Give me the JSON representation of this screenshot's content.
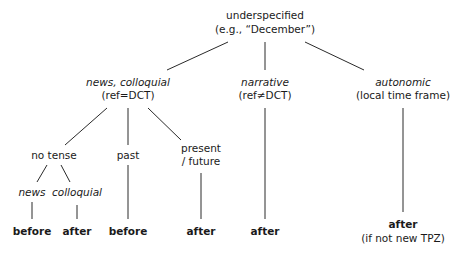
{
  "diagram": {
    "type": "tree",
    "nodes": {
      "root": {
        "line1": "underspecified",
        "line2": "(e.g., “December”)"
      },
      "news_colloquial": {
        "line1": "news, colloquial",
        "line2": "(ref=DCT)"
      },
      "narrative": {
        "line1": "narrative",
        "line2": "(ref≠DCT)"
      },
      "autonomic": {
        "line1": "autonomic",
        "line2": "(local time frame)"
      },
      "no_tense": {
        "label": "no tense"
      },
      "past": {
        "label": "past"
      },
      "present_future": {
        "line1": "present",
        "line2": "/ future"
      },
      "news": {
        "label": "news"
      },
      "colloquial": {
        "label": "colloquial"
      }
    },
    "leaves": {
      "news_result": "before",
      "colloquial_result": "after",
      "past_result": "before",
      "present_future_result": "after",
      "narrative_result": "after",
      "autonomic_result": {
        "line1": "after",
        "line2": "(if not new TPZ)"
      }
    },
    "edges": [
      [
        "root",
        "news_colloquial"
      ],
      [
        "root",
        "narrative"
      ],
      [
        "root",
        "autonomic"
      ],
      [
        "news_colloquial",
        "no_tense"
      ],
      [
        "news_colloquial",
        "past"
      ],
      [
        "news_colloquial",
        "present_future"
      ],
      [
        "no_tense",
        "news"
      ],
      [
        "no_tense",
        "colloquial"
      ],
      [
        "news",
        "news_result"
      ],
      [
        "colloquial",
        "colloquial_result"
      ],
      [
        "past",
        "past_result"
      ],
      [
        "present_future",
        "present_future_result"
      ],
      [
        "narrative",
        "narrative_result"
      ],
      [
        "autonomic",
        "autonomic_result"
      ]
    ]
  }
}
